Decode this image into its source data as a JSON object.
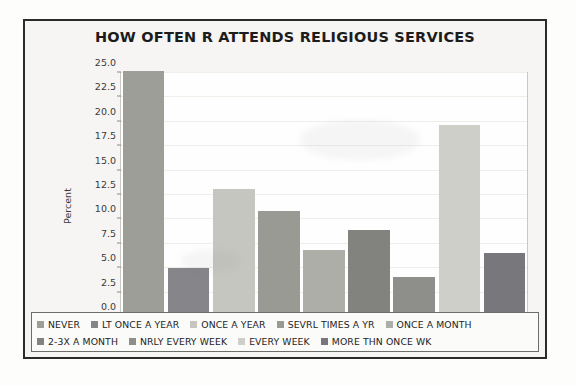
{
  "chart_data": {
    "type": "bar",
    "title": "HOW OFTEN R ATTENDS RELIGIOUS SERVICES",
    "xlabel": "",
    "ylabel": "Percent",
    "ylim": [
      0,
      25
    ],
    "grid": true,
    "legend_position": "bottom",
    "categories": [
      "NEVER",
      "LT ONCE A YEAR",
      "ONCE A YEAR",
      "SEVRL TIMES A YR",
      "ONCE A MONTH",
      "2-3X A MONTH",
      "NRLY EVERY WEEK",
      "EVERY WEEK",
      "MORE THN ONCE WK"
    ],
    "values": [
      25.2,
      5.0,
      13.1,
      10.9,
      6.9,
      8.9,
      4.1,
      19.7,
      6.6
    ],
    "colors": [
      "#9e9e99",
      "#86868a",
      "#c6c6c1",
      "#9a9a95",
      "#aeaea9",
      "#82827f",
      "#8e8e8b",
      "#cfcfca",
      "#78787c"
    ],
    "ytick_labels": [
      "25.0",
      "22.5",
      "20.0",
      "17.5",
      "15.0",
      "12.5",
      "10.0",
      "7.5",
      "5.0",
      "2.5",
      "0.0"
    ],
    "ytick_values": [
      25.0,
      22.5,
      20.0,
      17.5,
      15.0,
      12.5,
      10.0,
      7.5,
      5.0,
      2.5,
      0.0
    ]
  },
  "legend": {
    "row1": [
      {
        "label": "NEVER",
        "color": "#9e9e99"
      },
      {
        "label": "LT ONCE A YEAR",
        "color": "#86868a"
      },
      {
        "label": "ONCE A YEAR",
        "color": "#c6c6c1"
      },
      {
        "label": "SEVRL TIMES A YR",
        "color": "#9a9a95"
      },
      {
        "label": "ONCE A MONTH",
        "color": "#aeaea9"
      }
    ],
    "row2": [
      {
        "label": "2-3X A MONTH",
        "color": "#82827f"
      },
      {
        "label": "NRLY EVERY WEEK",
        "color": "#8e8e8b"
      },
      {
        "label": "EVERY WEEK",
        "color": "#cfcfca"
      },
      {
        "label": "MORE THN ONCE WK",
        "color": "#78787c"
      }
    ]
  }
}
